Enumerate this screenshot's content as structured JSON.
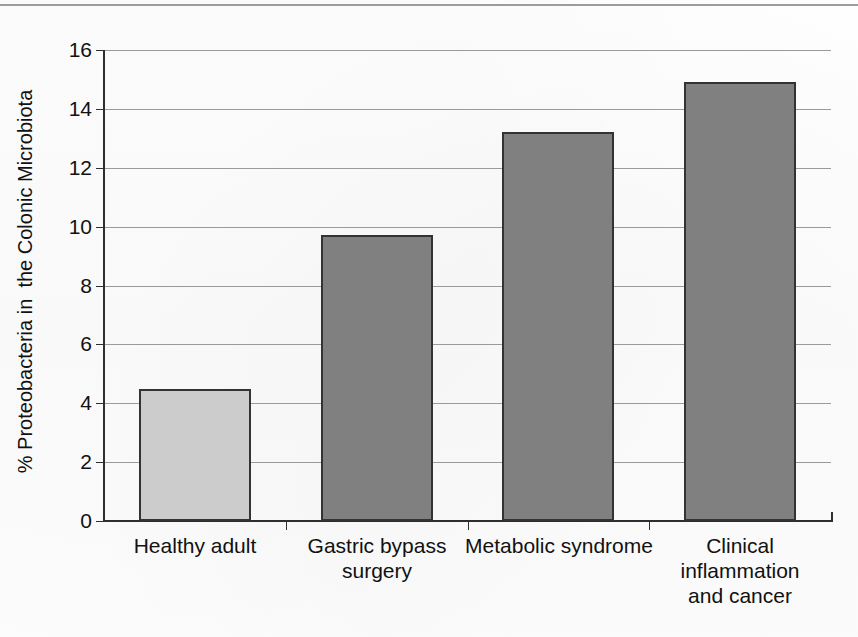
{
  "page": {
    "has_top_rule": true,
    "background_color": "#fdfdfd"
  },
  "chart_data": {
    "type": "bar",
    "title": "",
    "subtitle": "",
    "xlabel": "",
    "ylabel": "% Proteobacteria in  the Colonic Microbiota",
    "categories": [
      "Healthy adult",
      "Gastric bypass surgery",
      "Metabolic syndrome",
      "Clinical inflammation and cancer"
    ],
    "category_lines": [
      [
        "Healthy adult"
      ],
      [
        "Gastric bypass",
        "surgery"
      ],
      [
        "Metabolic syndrome"
      ],
      [
        "Clinical",
        "inflammation",
        "and cancer"
      ]
    ],
    "values": [
      4.5,
      9.7,
      13.2,
      14.9
    ],
    "bar_colors": [
      "#cccccc",
      "#808080",
      "#808080",
      "#808080"
    ],
    "bar_border_color": "#333333",
    "ylim": [
      0,
      16
    ],
    "ytick_labels": [
      "16",
      "14",
      "12",
      "10",
      "8",
      "6",
      "4",
      "2",
      "0"
    ],
    "ytick_values": [
      16,
      14,
      12,
      10,
      8,
      6,
      4,
      2,
      0
    ],
    "ytick_interval": 2,
    "grid": true,
    "gridline_color": "#9a9a9a",
    "axis_color": "#2e2e2e",
    "legend": null,
    "legend_position": "none",
    "annotations": []
  }
}
